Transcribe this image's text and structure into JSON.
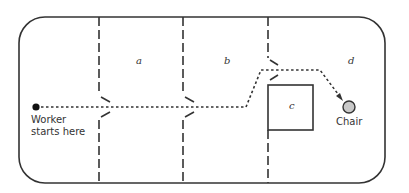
{
  "diagram": {
    "rooms": [
      {
        "id": "a",
        "label": "a"
      },
      {
        "id": "b",
        "label": "b"
      },
      {
        "id": "c",
        "label": "c"
      },
      {
        "id": "d",
        "label": "d"
      }
    ],
    "start": {
      "label_line1": "Worker",
      "label_line2": "starts here"
    },
    "destination": {
      "label": "Chair",
      "color": "#c8c8c8"
    },
    "colors": {
      "line": "#333333",
      "background": "#ffffff"
    }
  }
}
